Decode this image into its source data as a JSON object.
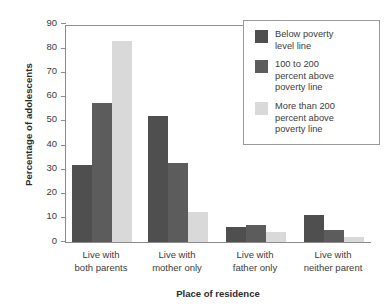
{
  "chart_data": {
    "type": "bar",
    "title": "",
    "xlabel": "Place of residence",
    "ylabel": "Percentage of adolescents",
    "categories": [
      "Live with both parents",
      "Live with mother only",
      "Live with father only",
      "Live with neither parent"
    ],
    "category_lines": [
      [
        "Live with",
        "both parents"
      ],
      [
        "Live with",
        "mother only"
      ],
      [
        "Live with",
        "father only"
      ],
      [
        "Live with",
        "neither parent"
      ]
    ],
    "series": [
      {
        "name": "Below poverty level line",
        "name_lines": [
          "Below poverty",
          "level line"
        ],
        "color": "#4f4f4f",
        "values": [
          32,
          52,
          6,
          11
        ]
      },
      {
        "name": "100 to 200 percent above poverty line",
        "name_lines": [
          "100 to 200",
          "percent above",
          "poverty line"
        ],
        "color": "#5c5c5c",
        "values": [
          57.5,
          32.5,
          7,
          5
        ]
      },
      {
        "name": "More than 200 percent above poverty line",
        "name_lines": [
          "More than 200",
          "percent above",
          "poverty line"
        ],
        "color": "#d9d9d9",
        "values": [
          83,
          12.5,
          4,
          2
        ]
      }
    ],
    "ylim": [
      0,
      90
    ],
    "yticks": [
      0,
      10,
      20,
      30,
      40,
      50,
      60,
      70,
      80,
      90
    ],
    "ytick_labels": [
      "0",
      "10",
      "20",
      "30",
      "40",
      "50",
      "60",
      "70",
      "80",
      "90"
    ],
    "grid": false,
    "legend_position": "top-right",
    "axis_color": "#8b8b8b"
  }
}
